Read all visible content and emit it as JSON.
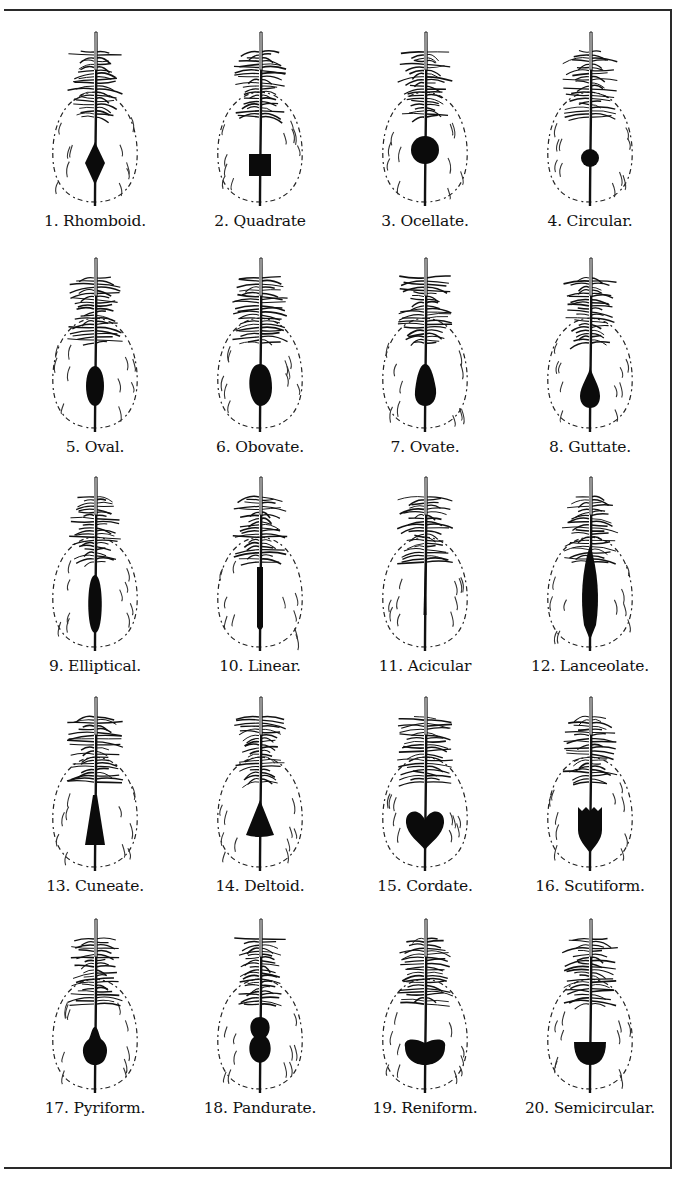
{
  "plate": {
    "feathers": [
      {
        "number": "1",
        "label": "1. Rhomboid.",
        "shape": "rhomboid"
      },
      {
        "number": "2",
        "label": "2. Quadrate",
        "shape": "quadrate"
      },
      {
        "number": "3",
        "label": "3. Ocellate.",
        "shape": "ocellate"
      },
      {
        "number": "4",
        "label": "4. Circular.",
        "shape": "circular"
      },
      {
        "number": "5",
        "label": "5. Oval.",
        "shape": "oval"
      },
      {
        "number": "6",
        "label": "6. Obovate.",
        "shape": "obovate"
      },
      {
        "number": "7",
        "label": "7. Ovate.",
        "shape": "ovate"
      },
      {
        "number": "8",
        "label": "8. Guttate.",
        "shape": "guttate"
      },
      {
        "number": "9",
        "label": "9. Elliptical.",
        "shape": "elliptical"
      },
      {
        "number": "10",
        "label": "10. Linear.",
        "shape": "linear"
      },
      {
        "number": "11",
        "label": "11. Acicular",
        "shape": "acicular"
      },
      {
        "number": "12",
        "label": "12. Lanceolate.",
        "shape": "lanceolate"
      },
      {
        "number": "13",
        "label": "13. Cuneate.",
        "shape": "cuneate"
      },
      {
        "number": "14",
        "label": "14. Deltoid.",
        "shape": "deltoid"
      },
      {
        "number": "15",
        "label": "15. Cordate.",
        "shape": "cordate"
      },
      {
        "number": "16",
        "label": "16. Scutiform.",
        "shape": "scutiform"
      },
      {
        "number": "17",
        "label": "17. Pyriform.",
        "shape": "pyriform"
      },
      {
        "number": "18",
        "label": "18. Pandurate.",
        "shape": "pandurate"
      },
      {
        "number": "19",
        "label": "19. Reniform.",
        "shape": "reniform"
      },
      {
        "number": "20",
        "label": "20. Semicircular.",
        "shape": "semicircular"
      }
    ]
  }
}
